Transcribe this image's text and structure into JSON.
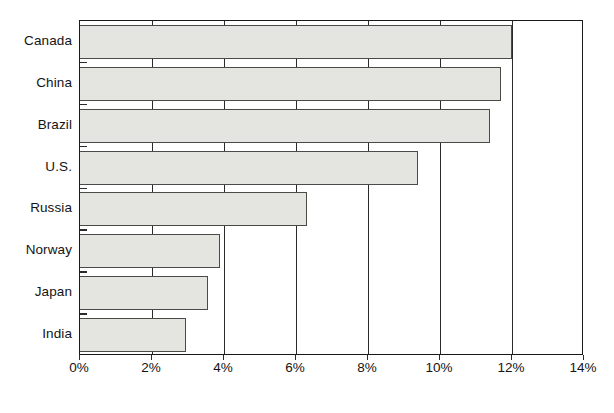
{
  "chart_data": {
    "type": "bar",
    "orientation": "horizontal",
    "title": "",
    "subtitle": "",
    "xlabel": "",
    "ylabel": "",
    "categories": [
      "Canada",
      "China",
      "Brazil",
      "U.S.",
      "Russia",
      "Norway",
      "Japan",
      "India"
    ],
    "values": [
      12.0,
      11.7,
      11.4,
      9.4,
      6.3,
      3.9,
      3.55,
      2.95
    ],
    "value_unit": "%",
    "xlim": [
      0,
      14
    ],
    "xtick_labels": [
      "0%",
      "2%",
      "4%",
      "6%",
      "8%",
      "10%",
      "12%",
      "14%"
    ],
    "xtick_values": [
      0,
      2,
      4,
      6,
      8,
      10,
      12,
      14
    ],
    "grid": "vertical",
    "legend": "none",
    "bar_fill_color": "#e4e4e0",
    "bar_border_color": "#4a4a46",
    "axis_color": "#1a1a1a",
    "gridline_color": "#2b2b2b",
    "background_color": "#ffffff"
  }
}
